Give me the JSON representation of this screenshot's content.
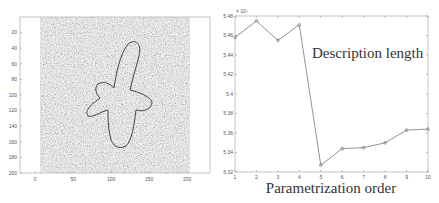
{
  "chart_data": [
    {
      "type": "heatmap",
      "title": "",
      "description": "Noisy grayscale image with segmented contour of a cross/propeller-shaped object",
      "xlabel": "",
      "ylabel": "",
      "xticks": [
        "0",
        "50",
        "100",
        "150",
        "200"
      ],
      "yticks": [
        "20",
        "40",
        "60",
        "80",
        "100",
        "120",
        "140",
        "160",
        "180",
        "200"
      ],
      "xlim": [
        -20,
        230
      ],
      "ylim": [
        0,
        200
      ]
    },
    {
      "type": "line",
      "title": "",
      "annotation": "Description length",
      "xlabel": "Parametrization order",
      "ylabel": "",
      "y_multiplier": "× 10⁴",
      "x": [
        1,
        2,
        3,
        4,
        5,
        6,
        7,
        8,
        9,
        10
      ],
      "series": [
        {
          "name": "Description length",
          "values": [
            5.458,
            5.475,
            5.455,
            5.471,
            5.327,
            5.344,
            5.345,
            5.35,
            5.363,
            5.364
          ]
        }
      ],
      "xticks": [
        "1",
        "2",
        "3",
        "4",
        "5",
        "6",
        "7",
        "8",
        "9",
        "10"
      ],
      "yticks": [
        "5.32",
        "5.34",
        "5.36",
        "5.38",
        "5.4",
        "5.42",
        "5.44",
        "5.46",
        "5.48"
      ],
      "xlim": [
        1,
        10
      ],
      "ylim": [
        5.32,
        5.48
      ],
      "grid": false,
      "legend": "none"
    }
  ]
}
